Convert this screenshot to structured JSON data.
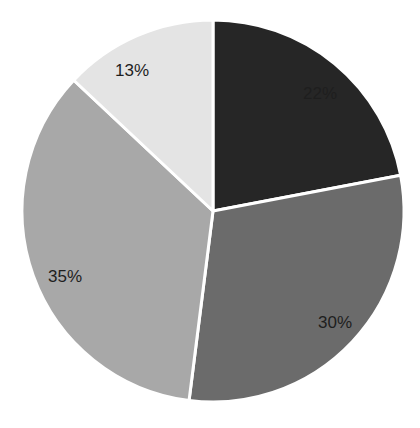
{
  "chart_data": {
    "type": "pie",
    "title": "",
    "categories": [
      "Slice 1",
      "Slice 2",
      "Slice 3",
      "Slice 4"
    ],
    "values": [
      22,
      30,
      35,
      13
    ],
    "labels": [
      "22%",
      "30%",
      "35%",
      "13%"
    ],
    "colors": [
      "#262626",
      "#6b6b6b",
      "#a8a8a8",
      "#e4e4e4"
    ],
    "start_angle_deg": 0,
    "direction": "clockwise",
    "legend": "none",
    "data_labels": "percent"
  },
  "geometry": {
    "cx": 213,
    "cy": 211,
    "r": 191,
    "label_positions": [
      {
        "x": 320,
        "y": 99
      },
      {
        "x": 335,
        "y": 328
      },
      {
        "x": 65,
        "y": 282
      },
      {
        "x": 132,
        "y": 76
      }
    ]
  }
}
